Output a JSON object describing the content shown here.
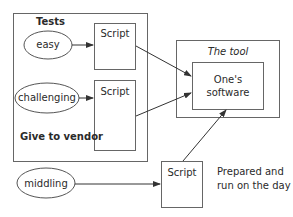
{
  "diagram": {
    "tests_group": {
      "title": "Tests",
      "footer": "Give to vendor"
    },
    "tests": [
      {
        "label": "easy"
      },
      {
        "label": "challenging"
      }
    ],
    "scripts": [
      {
        "label": "Script"
      },
      {
        "label": "Script"
      },
      {
        "label": "Script"
      }
    ],
    "extra_test": {
      "label": "middling"
    },
    "tool": {
      "title": "The tool",
      "inner_label_line1": "One's",
      "inner_label_line2": "software"
    },
    "note": {
      "line1": "Prepared and",
      "line2": "run on the day"
    },
    "colors": {
      "stroke": "#555555",
      "text": "#2a2a2a",
      "background": "#ffffff"
    }
  }
}
